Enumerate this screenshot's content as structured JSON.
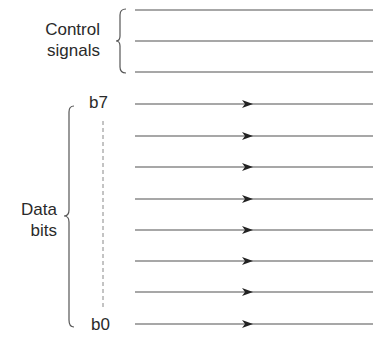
{
  "control": {
    "label_line1": "Control",
    "label_line2": "signals",
    "lines_y": [
      10,
      41,
      72
    ]
  },
  "data": {
    "label_line1": "Data",
    "label_line2": "bits",
    "msb_label": "b7",
    "lsb_label": "b0",
    "lines_y": [
      104,
      136,
      167,
      199,
      230,
      261,
      292,
      324
    ]
  },
  "colors": {
    "line": "#8a8a8a",
    "arrow": "#222222",
    "text": "#2a2a2a"
  }
}
